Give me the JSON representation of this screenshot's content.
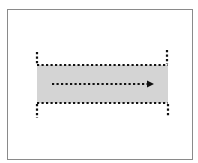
{
  "diagram": {
    "colors": {
      "frame_border": "#8a8a8a",
      "band_fill": "#d4d4d4",
      "dots": "#111111"
    },
    "band": {
      "x": 37,
      "y": 65,
      "width": 131,
      "height": 38
    },
    "arrow": {
      "direction": "right",
      "x1": 52,
      "x2": 154,
      "y": 84
    },
    "labels": []
  }
}
